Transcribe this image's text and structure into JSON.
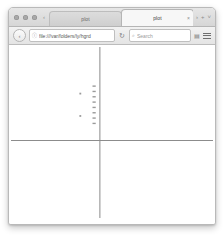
{
  "window": {
    "traffic_lights": [
      "close",
      "minimize",
      "zoom"
    ]
  },
  "tab_bar": {
    "scroll_back_label": "‹",
    "scroll_forward_label": "›",
    "new_tab_label": "+",
    "list_all_tabs_label": "˅",
    "tabs": [
      {
        "label": "plot",
        "active": false,
        "close_label": "×"
      },
      {
        "label": "plot",
        "active": true,
        "close_label": "×"
      }
    ]
  },
  "nav_toolbar": {
    "back_label": "‹",
    "url": "file:///var/folders/ly/hgrd",
    "url_placeholder": "Search or enter address",
    "lock_icon": "ⓘ",
    "reload_label": "↻",
    "search_value": "",
    "search_placeholder": "Search",
    "search_icon": "⌕",
    "bookmark_icon": "▤",
    "menu_icon": "menu"
  },
  "chart_data": {
    "type": "scatter",
    "title": "",
    "xlabel": "",
    "ylabel": "",
    "grid": false,
    "legend": null,
    "axis_color": "#8c8c8c",
    "point_color": "#9a9a9a",
    "xlim": [
      -5,
      5
    ],
    "ylim": [
      -4.2,
      4.2
    ],
    "origin_px": {
      "x": 90,
      "y": 96
    },
    "axes": {
      "x_axis_y": 0,
      "y_axis_x": 0
    },
    "series": [
      {
        "name": "column",
        "marker": "dash",
        "points": [
          {
            "x": -0.28,
            "y": 2.55
          },
          {
            "x": -0.28,
            "y": 2.3
          },
          {
            "x": -0.28,
            "y": 2.05
          },
          {
            "x": -0.28,
            "y": 1.8
          },
          {
            "x": -0.28,
            "y": 1.55
          },
          {
            "x": -0.28,
            "y": 1.3
          },
          {
            "x": -0.28,
            "y": 1.05
          },
          {
            "x": -0.28,
            "y": 0.8
          }
        ]
      },
      {
        "name": "outliers",
        "marker": "dot",
        "points": [
          {
            "x": -0.95,
            "y": 2.2
          },
          {
            "x": -0.95,
            "y": 1.15
          }
        ]
      }
    ]
  }
}
